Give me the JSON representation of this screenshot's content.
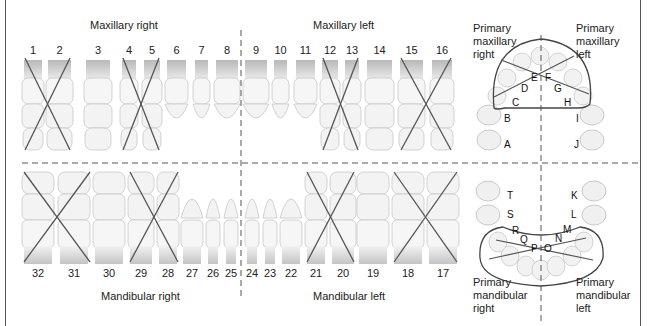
{
  "quadrant_labels": {
    "maxillary_right": "Maxillary right",
    "maxillary_left": "Maxillary left",
    "mandibular_right": "Mandibular right",
    "mandibular_left": "Mandibular left"
  },
  "primary_labels": {
    "max_right": [
      "Primary",
      "maxillary",
      "right"
    ],
    "max_left": [
      "Primary",
      "maxillary",
      "left"
    ],
    "mand_right": [
      "Primary",
      "mandibular",
      "right"
    ],
    "mand_left": [
      "Primary",
      "mandibular",
      "left"
    ]
  },
  "upper_teeth": [
    {
      "n": "1",
      "x": 22,
      "w": 22,
      "crossed": true
    },
    {
      "n": "2",
      "x": 46,
      "w": 27,
      "crossed": true
    },
    {
      "n": "3",
      "x": 84,
      "w": 28,
      "crossed": false
    },
    {
      "n": "4",
      "x": 120,
      "w": 18,
      "crossed": true
    },
    {
      "n": "5",
      "x": 142,
      "w": 20,
      "crossed": true
    },
    {
      "n": "6",
      "x": 165,
      "w": 23,
      "crossed": false
    },
    {
      "n": "7",
      "x": 193,
      "w": 17,
      "crossed": false
    },
    {
      "n": "8",
      "x": 214,
      "w": 26,
      "crossed": false
    },
    {
      "n": "9",
      "x": 243,
      "w": 26,
      "crossed": false
    },
    {
      "n": "10",
      "x": 272,
      "w": 17,
      "crossed": false
    },
    {
      "n": "11",
      "x": 294,
      "w": 23,
      "crossed": false
    },
    {
      "n": "12",
      "x": 320,
      "w": 20,
      "crossed": true
    },
    {
      "n": "13",
      "x": 343,
      "w": 18,
      "crossed": true
    },
    {
      "n": "14",
      "x": 365,
      "w": 29,
      "crossed": false
    },
    {
      "n": "15",
      "x": 398,
      "w": 27,
      "crossed": true
    },
    {
      "n": "16",
      "x": 430,
      "w": 24,
      "crossed": true
    }
  ],
  "lower_teeth": [
    {
      "n": "32",
      "x": 22,
      "w": 32,
      "crossed": true
    },
    {
      "n": "31",
      "x": 58,
      "w": 32,
      "crossed": true
    },
    {
      "n": "30",
      "x": 93,
      "w": 32,
      "crossed": false
    },
    {
      "n": "29",
      "x": 128,
      "w": 26,
      "crossed": true
    },
    {
      "n": "28",
      "x": 157,
      "w": 22,
      "crossed": true
    },
    {
      "n": "27",
      "x": 181,
      "w": 22,
      "crossed": false
    },
    {
      "n": "26",
      "x": 206,
      "w": 14,
      "crossed": false
    },
    {
      "n": "25",
      "x": 224,
      "w": 14,
      "crossed": false
    },
    {
      "n": "24",
      "x": 245,
      "w": 14,
      "crossed": false
    },
    {
      "n": "23",
      "x": 263,
      "w": 14,
      "crossed": false
    },
    {
      "n": "22",
      "x": 280,
      "w": 22,
      "crossed": false
    },
    {
      "n": "21",
      "x": 305,
      "w": 22,
      "crossed": true
    },
    {
      "n": "20",
      "x": 330,
      "w": 26,
      "crossed": true
    },
    {
      "n": "19",
      "x": 357,
      "w": 32,
      "crossed": false
    },
    {
      "n": "18",
      "x": 392,
      "w": 32,
      "crossed": true
    },
    {
      "n": "17",
      "x": 427,
      "w": 32,
      "crossed": true
    }
  ],
  "primary_letters": {
    "upper": [
      "A",
      "B",
      "C",
      "D",
      "E",
      "F",
      "G",
      "H",
      "I",
      "J"
    ],
    "lower": [
      "K",
      "L",
      "M",
      "N",
      "O",
      "P",
      "Q",
      "R",
      "S",
      "T"
    ]
  }
}
